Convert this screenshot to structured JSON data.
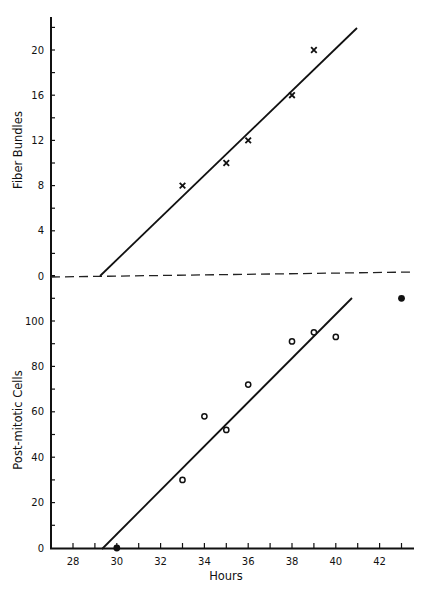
{
  "chart_data": [
    {
      "type": "scatter",
      "panel": "upper",
      "title": "",
      "xlabel": "Hours",
      "ylabel": "Fiber Bundles",
      "ylim": [
        0,
        22
      ],
      "xlim": [
        27,
        43.5
      ],
      "yticks": [
        0,
        4,
        8,
        12,
        16,
        20
      ],
      "grid": false,
      "series": [
        {
          "name": "Fiber Bundles",
          "marker": "x",
          "points": [
            {
              "x": 33,
              "y": 8
            },
            {
              "x": 35,
              "y": 10
            },
            {
              "x": 36,
              "y": 12
            },
            {
              "x": 38,
              "y": 16
            },
            {
              "x": 39,
              "y": 20
            }
          ]
        },
        {
          "name": "Regression line",
          "style": "solid line",
          "points": [
            {
              "x": 29.3,
              "y": 0
            },
            {
              "x": 41.0,
              "y": 22
            }
          ]
        }
      ],
      "annotations": [
        "Dashed baseline at 0 separating panels"
      ]
    },
    {
      "type": "scatter",
      "panel": "lower",
      "title": "",
      "xlabel": "Hours",
      "ylabel": "Post-mitotic Cells",
      "ylim": [
        0,
        110
      ],
      "xlim": [
        27,
        43.5
      ],
      "xticks": [
        28,
        30,
        32,
        34,
        36,
        38,
        40,
        42
      ],
      "yticks": [
        0,
        20,
        40,
        60,
        80,
        100
      ],
      "grid": false,
      "series": [
        {
          "name": "Post-mitotic Cells (open)",
          "marker": "open-circle",
          "points": [
            {
              "x": 33,
              "y": 30
            },
            {
              "x": 34,
              "y": 58
            },
            {
              "x": 35,
              "y": 52
            },
            {
              "x": 36,
              "y": 72
            },
            {
              "x": 38,
              "y": 91
            },
            {
              "x": 39,
              "y": 95
            },
            {
              "x": 40,
              "y": 93
            }
          ]
        },
        {
          "name": "Post-mitotic Cells (filled)",
          "marker": "filled-circle",
          "points": [
            {
              "x": 30,
              "y": 0
            },
            {
              "x": 43,
              "y": 110
            }
          ]
        },
        {
          "name": "Regression line",
          "style": "solid line",
          "points": [
            {
              "x": 29.4,
              "y": 0
            },
            {
              "x": 40.7,
              "y": 110
            }
          ]
        }
      ]
    }
  ],
  "labels": {
    "upper_ylabel": "Fiber Bundles",
    "lower_ylabel": "Post-mitotic Cells",
    "xlabel": "Hours",
    "upper_ticks": [
      "20",
      "16",
      "12",
      "8",
      "4",
      "0"
    ],
    "lower_ticks": [
      "100",
      "80",
      "60",
      "40",
      "20",
      "0"
    ],
    "x_ticks": [
      "28",
      "30",
      "32",
      "34",
      "36",
      "38",
      "40",
      "42"
    ]
  }
}
